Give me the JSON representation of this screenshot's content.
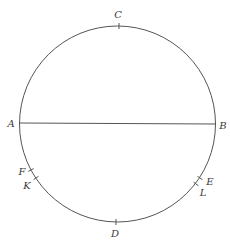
{
  "diagram": {
    "type": "circle-with-diameter",
    "stroke_color": "#555555",
    "label_color": "#3a3a3a",
    "circle": {
      "cx": 117.5,
      "cy": 124,
      "r": 98
    },
    "diameter": {
      "from": "A",
      "to": "B"
    },
    "points": [
      {
        "id": "A",
        "label": "A",
        "x": 19.5,
        "y": 123,
        "label_x": 11,
        "label_y": 124
      },
      {
        "id": "B",
        "label": "B",
        "x": 215.5,
        "y": 124,
        "label_x": 223,
        "label_y": 126
      },
      {
        "id": "C",
        "label": "C",
        "x": 119,
        "y": 26,
        "label_x": 118,
        "label_y": 15
      },
      {
        "id": "D",
        "label": "D",
        "x": 116,
        "y": 222,
        "label_x": 115,
        "label_y": 234
      },
      {
        "id": "F",
        "label": "F",
        "x": 31,
        "y": 170,
        "label_x": 22,
        "label_y": 172
      },
      {
        "id": "K",
        "label": "K",
        "x": 36,
        "y": 178,
        "label_x": 27,
        "label_y": 186
      },
      {
        "id": "E",
        "label": "E",
        "x": 200,
        "y": 178,
        "label_x": 210,
        "label_y": 182
      },
      {
        "id": "L",
        "label": "L",
        "x": 196,
        "y": 184,
        "label_x": 203,
        "label_y": 193
      }
    ]
  },
  "labels": {
    "A": "A",
    "B": "B",
    "C": "C",
    "D": "D",
    "E": "E",
    "F": "F",
    "K": "K",
    "L": "L"
  }
}
